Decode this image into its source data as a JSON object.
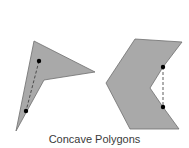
{
  "figure": {
    "caption": "Concave Polygons",
    "colors": {
      "fill": "#a9a9a9",
      "stroke": "#6e6e6e",
      "diagonal": "#333333",
      "point": "#000000",
      "caption": "#3a3a3a"
    },
    "shapes": [
      {
        "name": "arrowhead-concave-polygon",
        "points": "34,41 95,72 44,80 16,131",
        "diagonal": {
          "x1": 39,
          "y1": 61,
          "x2": 26,
          "y2": 111
        },
        "dots": [
          {
            "x": 39,
            "y": 61
          },
          {
            "x": 26,
            "y": 111
          }
        ]
      },
      {
        "name": "chevron-concave-polygon",
        "points": "135,39 182,42 163,67 150,88 163,107 179,129 130,129 106,83",
        "diagonal": {
          "x1": 163,
          "y1": 67,
          "x2": 163,
          "y2": 107
        },
        "dots": [
          {
            "x": 163,
            "y": 67
          },
          {
            "x": 163,
            "y": 107
          }
        ]
      }
    ]
  }
}
